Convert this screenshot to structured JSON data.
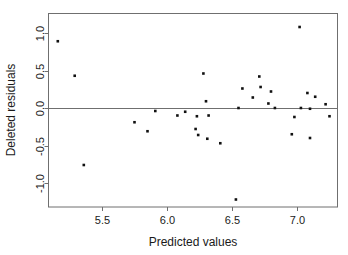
{
  "chart_data": {
    "type": "scatter",
    "title": "",
    "xlabel": "Predicted values",
    "ylabel": "Deleted residuals",
    "xlim": [
      5.12,
      7.35
    ],
    "ylim": [
      -1.27,
      1.26
    ],
    "xticks": [
      5.5,
      6.0,
      6.5,
      7.0
    ],
    "xticklabels": [
      "5.5",
      "6.0",
      "6.5",
      "7.0"
    ],
    "yticks": [
      1.0,
      0.5,
      0.0,
      -0.5,
      -1.0
    ],
    "yticklabels": [
      "1.0",
      "0.5",
      "0.0",
      "-0.5",
      "-1.0"
    ],
    "grid": false,
    "legend": null,
    "reference_lines": [
      {
        "axis": "y",
        "value": 0.0,
        "color": "#6f6f6f"
      }
    ],
    "marker": {
      "shape": "square",
      "size": 2.6,
      "color": "#111111"
    },
    "n_points": 33,
    "points": [
      {
        "x": 5.16,
        "y": 0.89
      },
      {
        "x": 5.29,
        "y": 0.43
      },
      {
        "x": 5.36,
        "y": -0.76
      },
      {
        "x": 5.75,
        "y": -0.19
      },
      {
        "x": 5.85,
        "y": -0.31
      },
      {
        "x": 5.91,
        "y": -0.04
      },
      {
        "x": 6.08,
        "y": -0.1
      },
      {
        "x": 6.14,
        "y": -0.05
      },
      {
        "x": 6.22,
        "y": -0.28
      },
      {
        "x": 6.23,
        "y": -0.11
      },
      {
        "x": 6.24,
        "y": -0.36
      },
      {
        "x": 6.28,
        "y": 0.46
      },
      {
        "x": 6.3,
        "y": 0.09
      },
      {
        "x": 6.31,
        "y": -0.41
      },
      {
        "x": 6.32,
        "y": -0.1
      },
      {
        "x": 6.41,
        "y": -0.47
      },
      {
        "x": 6.53,
        "y": -1.22
      },
      {
        "x": 6.55,
        "y": 0.0
      },
      {
        "x": 6.58,
        "y": 0.26
      },
      {
        "x": 6.66,
        "y": 0.14
      },
      {
        "x": 6.71,
        "y": 0.42
      },
      {
        "x": 6.72,
        "y": 0.28
      },
      {
        "x": 6.78,
        "y": 0.06
      },
      {
        "x": 6.8,
        "y": 0.22
      },
      {
        "x": 6.83,
        "y": 0.0
      },
      {
        "x": 6.96,
        "y": -0.35
      },
      {
        "x": 6.98,
        "y": -0.12
      },
      {
        "x": 7.02,
        "y": 1.08
      },
      {
        "x": 7.03,
        "y": 0.0
      },
      {
        "x": 7.08,
        "y": 0.2
      },
      {
        "x": 7.1,
        "y": -0.01
      },
      {
        "x": 7.1,
        "y": -0.4
      },
      {
        "x": 7.14,
        "y": 0.15
      },
      {
        "x": 7.22,
        "y": 0.05
      },
      {
        "x": 7.25,
        "y": -0.11
      }
    ]
  },
  "colors": {
    "background": "#ffffff",
    "axis": "#6f6f6f",
    "marker": "#111111",
    "text": "#1a1a1a"
  }
}
